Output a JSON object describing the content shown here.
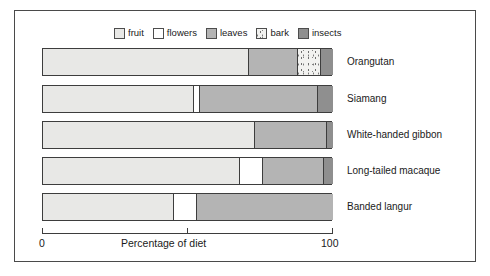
{
  "legend": {
    "items": [
      {
        "label": "fruit",
        "key": "fruit",
        "color": "#e8e8e6"
      },
      {
        "label": "flowers",
        "key": "flowers",
        "color": "#ffffff"
      },
      {
        "label": "leaves",
        "key": "leaves",
        "color": "#b4b4b4"
      },
      {
        "label": "bark",
        "key": "bark",
        "color": "#f2f2f0"
      },
      {
        "label": "insects",
        "key": "insects",
        "color": "#8f8f8f"
      }
    ]
  },
  "axis": {
    "min_label": "0",
    "max_label": "100",
    "title": "Percentage of diet"
  },
  "chart_data": {
    "type": "bar",
    "orientation": "horizontal",
    "stacked": true,
    "percent_stacked": true,
    "title": "",
    "xlabel": "Percentage of diet",
    "ylabel": "",
    "xlim": [
      0,
      100
    ],
    "xticks": [
      0,
      100
    ],
    "xticklabels": [
      "0",
      "100"
    ],
    "grid": false,
    "legend_position": "top-center",
    "categories": [
      "Orangutan",
      "Siamang",
      "White-handed gibbon",
      "Long-tailed macaque",
      "Banded langur"
    ],
    "series": [
      {
        "name": "fruit",
        "color": "#e8e8e6",
        "values": [
          71,
          52,
          73,
          68,
          45
        ]
      },
      {
        "name": "flowers",
        "color": "#ffffff",
        "values": [
          0,
          2,
          0,
          8,
          8
        ]
      },
      {
        "name": "leaves",
        "color": "#b4b4b4",
        "values": [
          17,
          41,
          25,
          21,
          47
        ]
      },
      {
        "name": "bark",
        "color": "#f2f2f0",
        "values": [
          8,
          0,
          0,
          0,
          0
        ]
      },
      {
        "name": "insects",
        "color": "#8f8f8f",
        "values": [
          4,
          5,
          2,
          3,
          0
        ]
      }
    ],
    "rows": [
      {
        "category": "Orangutan",
        "segments": [
          {
            "key": "fruit",
            "label": "fruit",
            "value": 71
          },
          {
            "key": "leaves",
            "label": "leaves",
            "value": 17
          },
          {
            "key": "bark",
            "label": "bark",
            "value": 8
          },
          {
            "key": "insects",
            "label": "insects",
            "value": 4
          }
        ]
      },
      {
        "category": "Siamang",
        "segments": [
          {
            "key": "fruit",
            "label": "fruit",
            "value": 52
          },
          {
            "key": "flowers",
            "label": "flowers",
            "value": 2
          },
          {
            "key": "leaves",
            "label": "leaves",
            "value": 41
          },
          {
            "key": "insects",
            "label": "insects",
            "value": 5
          }
        ]
      },
      {
        "category": "White-handed gibbon",
        "segments": [
          {
            "key": "fruit",
            "label": "fruit",
            "value": 73
          },
          {
            "key": "leaves",
            "label": "leaves",
            "value": 25
          },
          {
            "key": "insects",
            "label": "insects",
            "value": 2
          }
        ]
      },
      {
        "category": "Long-tailed macaque",
        "segments": [
          {
            "key": "fruit",
            "label": "fruit",
            "value": 68
          },
          {
            "key": "flowers",
            "label": "flowers",
            "value": 8
          },
          {
            "key": "leaves",
            "label": "leaves",
            "value": 21
          },
          {
            "key": "insects",
            "label": "insects",
            "value": 3
          }
        ]
      },
      {
        "category": "Banded langur",
        "segments": [
          {
            "key": "fruit",
            "label": "fruit",
            "value": 45
          },
          {
            "key": "flowers",
            "label": "flowers",
            "value": 8
          },
          {
            "key": "leaves",
            "label": "leaves",
            "value": 47
          }
        ]
      }
    ]
  }
}
